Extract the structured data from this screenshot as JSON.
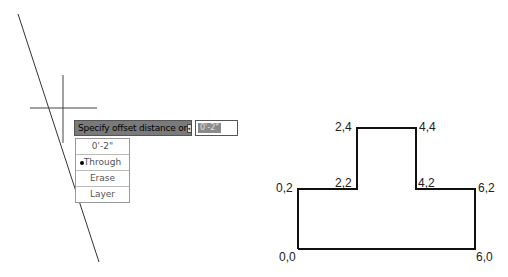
{
  "command": {
    "prompt": "Specify offset distance or",
    "input_value": "0'-2\"",
    "options": [
      {
        "label": "0'-2\"",
        "selected": false
      },
      {
        "label": "Through",
        "selected": true
      },
      {
        "label": "Erase",
        "selected": false
      },
      {
        "label": "Layer",
        "selected": false
      }
    ]
  },
  "drawing": {
    "points": [
      {
        "label": "2,4"
      },
      {
        "label": "4,4"
      },
      {
        "label": "0,2"
      },
      {
        "label": "2,2"
      },
      {
        "label": "4,2"
      },
      {
        "label": "6,2"
      },
      {
        "label": "0,0"
      },
      {
        "label": "6,0"
      }
    ]
  }
}
